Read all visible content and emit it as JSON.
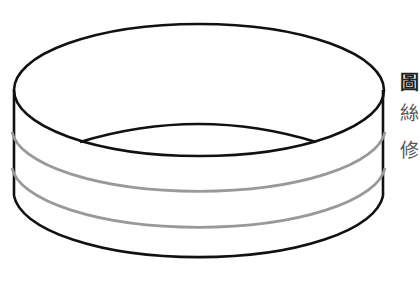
{
  "figure": {
    "colors": {
      "outline": "#111111",
      "bands": "#999999",
      "background": "#ffffff"
    }
  },
  "caption": {
    "lines": [
      "圖",
      "絲",
      "修"
    ]
  }
}
